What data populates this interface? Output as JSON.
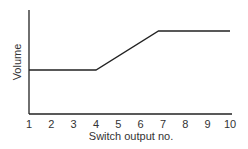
{
  "chart_data": {
    "type": "line",
    "title": "",
    "xlabel": "Switch output no.",
    "ylabel": "Volume",
    "x_ticks": [
      "1",
      "2",
      "3",
      "4",
      "5",
      "6",
      "7",
      "8",
      "9",
      "10"
    ],
    "xlim": [
      1,
      10
    ],
    "y_ticks": [],
    "grid": false,
    "legend": null,
    "series": [
      {
        "name": "Volume",
        "points": [
          {
            "x": 1,
            "y": 1
          },
          {
            "x": 4,
            "y": 1
          },
          {
            "x": 6.8,
            "y": 2
          },
          {
            "x": 10,
            "y": 2
          }
        ]
      }
    ],
    "annotations": "Relative volume: constant low from 1 to 4, rises linearly to ~6.8, then constant high to 10"
  }
}
